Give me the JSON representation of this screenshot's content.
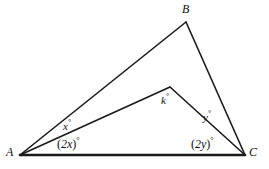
{
  "figure": {
    "background_color": "#ffffff",
    "stroke_color": "#1a1a1a",
    "width": 269,
    "height": 169,
    "vertices": {
      "A": {
        "label": "A",
        "x": 20,
        "y": 155,
        "label_x": 6,
        "label_y": 146
      },
      "B": {
        "label": "B",
        "x": 186,
        "y": 22,
        "label_x": 182,
        "label_y": 3
      },
      "C": {
        "label": "C",
        "x": 245,
        "y": 155,
        "label_x": 249,
        "label_y": 146
      },
      "D": {
        "label": "",
        "x": 170,
        "y": 87,
        "label_x": 0,
        "label_y": 0
      }
    },
    "segments": [
      {
        "name": "AB",
        "from": "A",
        "to": "B",
        "width": 1.6
      },
      {
        "name": "BC",
        "from": "B",
        "to": "C",
        "width": 1.6
      },
      {
        "name": "AC",
        "from": "A",
        "to": "C",
        "width": 2.6
      },
      {
        "name": "AD",
        "from": "A",
        "to": "D",
        "width": 1.6
      },
      {
        "name": "DC",
        "from": "D",
        "to": "C",
        "width": 1.6
      }
    ],
    "angle_labels": {
      "x": {
        "text": "x",
        "degree": "°",
        "x": 63,
        "y": 119
      },
      "two_x": {
        "open": "(",
        "text": "2x",
        "close": ")",
        "degree": "°",
        "x": 57,
        "y": 136
      },
      "k": {
        "text": "k",
        "degree": "°",
        "x": 161,
        "y": 93
      },
      "y": {
        "text": "y",
        "degree": "°",
        "x": 203,
        "y": 110
      },
      "two_y": {
        "open": "(",
        "text": "2y",
        "close": ")",
        "degree": "°",
        "x": 191,
        "y": 136
      }
    }
  }
}
